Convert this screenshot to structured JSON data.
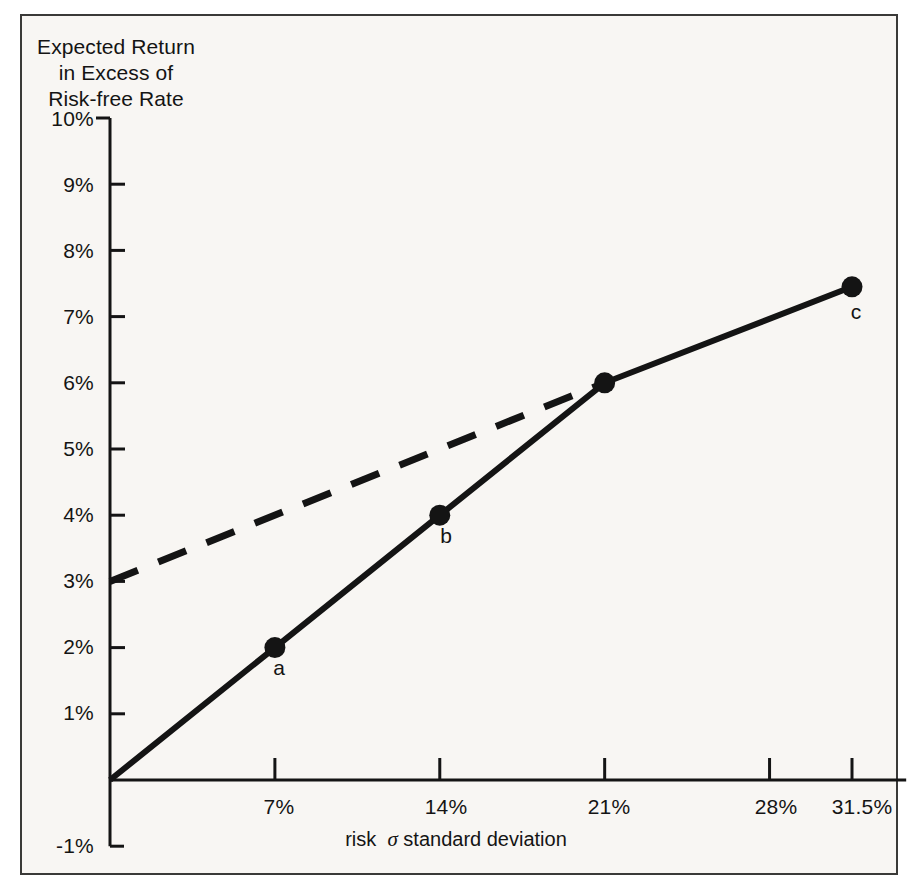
{
  "figure": {
    "background_color": "#f8f6f3",
    "frame_color": "#3a3a38",
    "ink_color": "#141414"
  },
  "chart_data": {
    "type": "line",
    "title": "",
    "ylabel_lines": [
      "Expected Return",
      "in Excess of",
      "Risk-free Rate"
    ],
    "xlabel": "risk σ standard deviation",
    "xlabel_prefix": "risk",
    "xlabel_sigma": "σ",
    "xlabel_suffix": "standard deviation",
    "xtick_labels": [
      "7%",
      "14%",
      "21%",
      "28%",
      "31.5%"
    ],
    "xtick_values": [
      7,
      14,
      21,
      28,
      31.5
    ],
    "ytick_labels": [
      "10%",
      "9%",
      "8%",
      "7%",
      "6%",
      "5%",
      "4%",
      "3%",
      "2%",
      "1%",
      "-1%"
    ],
    "ytick_values": [
      10,
      9,
      8,
      7,
      6,
      5,
      4,
      3,
      2,
      1,
      -1
    ],
    "xlim": [
      0,
      33.8
    ],
    "ylim": [
      -1,
      10
    ],
    "grid": false,
    "legend": "none",
    "series": [
      {
        "name": "efficient frontier (solid)",
        "style": "solid",
        "marker": "filled-circle",
        "points": [
          {
            "x": 0,
            "y": 0,
            "label": "",
            "marker": false
          },
          {
            "x": 7,
            "y": 2,
            "label": "a",
            "marker": true
          },
          {
            "x": 14,
            "y": 4,
            "label": "b",
            "marker": true
          },
          {
            "x": 21,
            "y": 6,
            "label": "",
            "marker": true
          },
          {
            "x": 31.5,
            "y": 7.45,
            "label": "c",
            "marker": true
          }
        ]
      },
      {
        "name": "tangent / borrowing-lending line (dashed)",
        "style": "dashed",
        "marker": "none",
        "points": [
          {
            "x": 0,
            "y": 3,
            "label": "",
            "marker": false
          },
          {
            "x": 21,
            "y": 6,
            "label": "",
            "marker": false
          }
        ]
      }
    ],
    "annotations": [
      {
        "text": "a",
        "x": 7,
        "y": 2
      },
      {
        "text": "b",
        "x": 14,
        "y": 4
      },
      {
        "text": "c",
        "x": 31.5,
        "y": 7.45
      }
    ]
  }
}
